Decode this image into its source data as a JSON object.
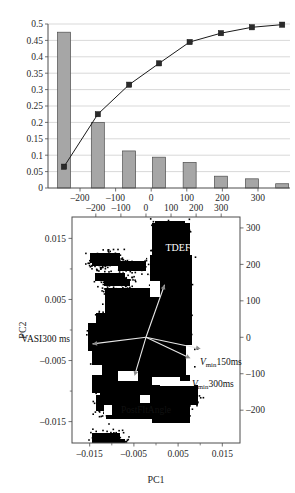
{
  "figure": {
    "name": "pca-scree-and-biplot",
    "panels": [
      "scree-pareto-chart",
      "pca-biplot"
    ]
  },
  "chart_data": [
    {
      "type": "bar",
      "name": "scree-pareto",
      "title": "",
      "xlabel": "",
      "ylabel": "",
      "ylim": [
        0,
        0.5
      ],
      "ytick_labels": [
        "0",
        "0.05",
        "0.1",
        "0.15",
        "0.2",
        "0.25",
        "0.3",
        "0.35",
        "0.4",
        "0.45",
        "0.5"
      ],
      "ytick_values": [
        0,
        0.05,
        0.1,
        0.15,
        0.2,
        0.25,
        0.3,
        0.35,
        0.4,
        0.45,
        0.5
      ],
      "xtick_labels": [
        "-200",
        "-100",
        "0",
        "100",
        "200",
        "300"
      ],
      "xtick_values": [
        -200,
        -100,
        0,
        100,
        200,
        300
      ],
      "xlim": [
        -290,
        390
      ],
      "grid": true,
      "categories": [
        "1",
        "2",
        "3",
        "4",
        "5",
        "6",
        "7",
        "8"
      ],
      "category_positions": [
        -245,
        -150,
        -62,
        22,
        108,
        196,
        283,
        368
      ],
      "values": [
        0.475,
        0.2,
        0.113,
        0.094,
        0.078,
        0.036,
        0.028,
        0.013
      ],
      "bar_color": "#a6a6a6",
      "bar_edge_color": "#4d4d4d",
      "series": [
        {
          "name": "cumulative",
          "type": "line",
          "values": [
            0.065,
            0.225,
            0.315,
            0.38,
            0.445,
            0.472,
            0.49,
            0.498
          ],
          "marker": "square",
          "color": "#1a1a1a"
        }
      ]
    },
    {
      "type": "scatter",
      "name": "pca-biplot",
      "title": "",
      "xlabel": "PC1",
      "ylabel": "PC2",
      "grid": false,
      "xlim": [
        -0.019,
        0.019
      ],
      "ylim": [
        -0.0185,
        0.0185
      ],
      "xtick_labels": [
        "-0.015",
        "-0.005",
        "0.005",
        "0.015"
      ],
      "xtick_values": [
        -0.015,
        -0.005,
        0.005,
        0.015
      ],
      "ytick_labels": [
        "0.015",
        "0.005",
        "-0.005",
        "-0.015"
      ],
      "ytick_values": [
        0.015,
        0.005,
        -0.005,
        -0.015
      ],
      "secondary_x_tick_labels": [
        "-200",
        "-100",
        "0",
        "100",
        "200",
        "300"
      ],
      "secondary_x_tick_values": [
        -200,
        -100,
        0,
        100,
        200,
        300
      ],
      "secondary_x_lim": [
        -295,
        375
      ],
      "secondary_y_tick_labels": [
        "300",
        "200",
        "100",
        "0",
        "-100",
        "-200"
      ],
      "secondary_y_tick_values": [
        300,
        200,
        100,
        0,
        -100,
        -200
      ],
      "secondary_y_lim": [
        -290,
        330
      ],
      "point_color": "#000000",
      "vectors": [
        {
          "label": "TDEF",
          "label_style": "plain",
          "dx": 62,
          "dy": 175
        },
        {
          "label": "VASI300 ms",
          "label_style": "plain",
          "dx": -178,
          "dy": -22
        },
        {
          "label": "150ms",
          "label_style": "vmin",
          "prefix": "V",
          "subscript": "min",
          "dx": 182,
          "dy": -38
        },
        {
          "label": "300ms",
          "label_style": "vmin",
          "prefix": "V",
          "subscript": "min",
          "dx": 148,
          "dy": -70
        },
        {
          "label": "PostFltAngle",
          "label_style": "plain",
          "dx": -38,
          "dy": -128
        }
      ]
    }
  ]
}
